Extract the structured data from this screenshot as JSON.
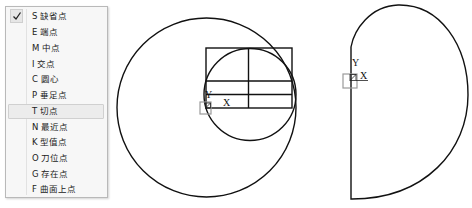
{
  "snap_menu": {
    "checked_index": 0,
    "hover_index": 6,
    "items": [
      {
        "key": "S",
        "label": "S 缺省点"
      },
      {
        "key": "E",
        "label": "E 端点"
      },
      {
        "key": "M",
        "label": "M 中点"
      },
      {
        "key": "I",
        "label": "I 交点"
      },
      {
        "key": "C",
        "label": "C 圆心"
      },
      {
        "key": "P",
        "label": "P 垂足点"
      },
      {
        "key": "T",
        "label": "T 切点"
      },
      {
        "key": "N",
        "label": "N 最近点"
      },
      {
        "key": "K",
        "label": "K 型值点"
      },
      {
        "key": "O",
        "label": "O 刀位点"
      },
      {
        "key": "G",
        "label": "G 存在点"
      },
      {
        "key": "F",
        "label": "F 曲面上点"
      }
    ]
  },
  "drawing": {
    "stroke_color": "#111111",
    "marker_color": "#9a9a9a",
    "figure1": {
      "axis_x_label": "X",
      "axis_y_label": "Y"
    },
    "figure2": {
      "axis_x_label": "X",
      "axis_y_label": "Y"
    }
  }
}
